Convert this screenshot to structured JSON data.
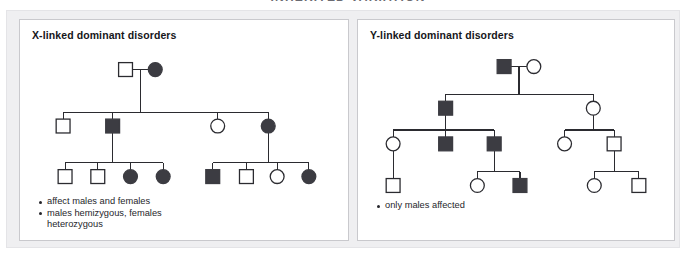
{
  "figure": {
    "headline": "INHERITED VARIATION",
    "background_color": "#ffffff",
    "frame_color": "#efeff1",
    "line_color": "#2b2b30",
    "affected_fill_color": "#3c3c42",
    "unaffected_fill_color": "#ffffff"
  },
  "panels": [
    {
      "id": "x-linked",
      "title": "X-linked dominant disorders",
      "legend": [
        "affect males and females",
        "males hemizygous, females\nheterozygous"
      ]
    },
    {
      "id": "y-linked",
      "title": "Y-linked dominant disorders",
      "legend": [
        "only males affected"
      ]
    }
  ],
  "chart_data": [
    {
      "type": "pedigree",
      "title": "X-linked dominant disorders",
      "symbol_key": {
        "square": "male",
        "circle": "female",
        "filled": "affected",
        "open": "unaffected"
      },
      "generations": 3,
      "individuals": [
        {
          "id": "I-1",
          "generation": 1,
          "sex": "male",
          "affected": false,
          "x": 118,
          "y": 58
        },
        {
          "id": "I-2",
          "generation": 1,
          "sex": "female",
          "affected": true,
          "x": 148,
          "y": 58
        },
        {
          "id": "II-1",
          "generation": 2,
          "sex": "male",
          "affected": false,
          "x": 55,
          "y": 115
        },
        {
          "id": "II-2",
          "generation": 2,
          "sex": "male",
          "affected": true,
          "x": 105,
          "y": 115
        },
        {
          "id": "II-3",
          "generation": 2,
          "sex": "female",
          "affected": false,
          "x": 211,
          "y": 115
        },
        {
          "id": "II-4",
          "generation": 2,
          "sex": "female",
          "affected": true,
          "x": 262,
          "y": 115
        },
        {
          "id": "III-1",
          "generation": 3,
          "sex": "male",
          "affected": false,
          "x": 57,
          "y": 166
        },
        {
          "id": "III-2",
          "generation": 3,
          "sex": "male",
          "affected": false,
          "x": 90,
          "y": 166
        },
        {
          "id": "III-3",
          "generation": 3,
          "sex": "female",
          "affected": true,
          "x": 123,
          "y": 166
        },
        {
          "id": "III-4",
          "generation": 3,
          "sex": "female",
          "affected": true,
          "x": 156,
          "y": 166
        },
        {
          "id": "III-5",
          "generation": 3,
          "sex": "male",
          "affected": true,
          "x": 206,
          "y": 166
        },
        {
          "id": "III-6",
          "generation": 3,
          "sex": "male",
          "affected": false,
          "x": 240,
          "y": 166
        },
        {
          "id": "III-7",
          "generation": 3,
          "sex": "female",
          "affected": false,
          "x": 271,
          "y": 166
        },
        {
          "id": "III-8",
          "generation": 3,
          "sex": "female",
          "affected": true,
          "x": 303,
          "y": 166
        }
      ],
      "matings": [
        {
          "parents": [
            "I-1",
            "I-2"
          ],
          "children": [
            "II-1",
            "II-2",
            "II-3",
            "II-4"
          ]
        },
        {
          "parents": [
            "II-2"
          ],
          "children": [
            "III-1",
            "III-2",
            "III-3",
            "III-4"
          ]
        },
        {
          "parents": [
            "II-4"
          ],
          "children": [
            "III-5",
            "III-6",
            "III-7",
            "III-8"
          ]
        }
      ]
    },
    {
      "type": "pedigree",
      "title": "Y-linked dominant disorders",
      "symbol_key": {
        "square": "male",
        "circle": "female",
        "filled": "affected",
        "open": "unaffected"
      },
      "generations": 4,
      "individuals": [
        {
          "id": "I-1",
          "generation": 1,
          "sex": "male",
          "affected": true,
          "x": 497,
          "y": 55
        },
        {
          "id": "I-2",
          "generation": 1,
          "sex": "female",
          "affected": false,
          "x": 527,
          "y": 55
        },
        {
          "id": "II-1",
          "generation": 2,
          "sex": "male",
          "affected": true,
          "x": 438,
          "y": 97
        },
        {
          "id": "II-2",
          "generation": 2,
          "sex": "female",
          "affected": false,
          "x": 587,
          "y": 97
        },
        {
          "id": "III-1",
          "generation": 3,
          "sex": "female",
          "affected": false,
          "x": 385,
          "y": 133
        },
        {
          "id": "III-2",
          "generation": 3,
          "sex": "male",
          "affected": true,
          "x": 438,
          "y": 133
        },
        {
          "id": "III-3",
          "generation": 3,
          "sex": "male",
          "affected": true,
          "x": 487,
          "y": 133
        },
        {
          "id": "III-4",
          "generation": 3,
          "sex": "female",
          "affected": false,
          "x": 558,
          "y": 133
        },
        {
          "id": "III-5",
          "generation": 3,
          "sex": "male",
          "affected": false,
          "x": 608,
          "y": 133
        },
        {
          "id": "IV-1",
          "generation": 4,
          "sex": "male",
          "affected": false,
          "x": 385,
          "y": 175
        },
        {
          "id": "IV-2",
          "generation": 4,
          "sex": "female",
          "affected": false,
          "x": 470,
          "y": 175
        },
        {
          "id": "IV-3",
          "generation": 4,
          "sex": "male",
          "affected": true,
          "x": 513,
          "y": 175
        },
        {
          "id": "IV-4",
          "generation": 4,
          "sex": "female",
          "affected": false,
          "x": 588,
          "y": 175
        },
        {
          "id": "IV-5",
          "generation": 4,
          "sex": "male",
          "affected": false,
          "x": 633,
          "y": 175
        }
      ],
      "matings": [
        {
          "parents": [
            "I-1",
            "I-2"
          ],
          "children": [
            "II-1",
            "II-2"
          ]
        },
        {
          "parents": [
            "II-1"
          ],
          "children": [
            "III-1",
            "III-2",
            "III-3"
          ]
        },
        {
          "parents": [
            "II-2"
          ],
          "children": [
            "III-4",
            "III-5"
          ]
        },
        {
          "parents": [
            "III-1"
          ],
          "children": [
            "IV-1"
          ]
        },
        {
          "parents": [
            "III-3"
          ],
          "children": [
            "IV-2",
            "IV-3"
          ]
        },
        {
          "parents": [
            "III-5"
          ],
          "children": [
            "IV-4",
            "IV-5"
          ]
        }
      ]
    }
  ]
}
